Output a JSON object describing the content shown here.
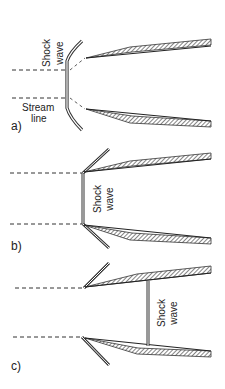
{
  "figure": {
    "panels": [
      {
        "id": "a",
        "label": "a)",
        "shock_label_line1": "Shock",
        "shock_label_line2": "wave",
        "streamline_label_line1": "Stream",
        "streamline_label_line2": "line",
        "description": "Detached curved bow shock ahead of inlet"
      },
      {
        "id": "b",
        "label": "b)",
        "shock_label_line1": "Shock",
        "shock_label_line2": "wave",
        "description": "Normal shock at inlet lip with oblique shocks"
      },
      {
        "id": "c",
        "label": "c)",
        "shock_label_line1": "Shock",
        "shock_label_line2": "wave",
        "description": "Oblique shocks at lip, normal shock inside duct"
      }
    ],
    "colors": {
      "line": "#333333",
      "hatch": "#333333",
      "text": "#222222",
      "background": "#ffffff"
    }
  }
}
